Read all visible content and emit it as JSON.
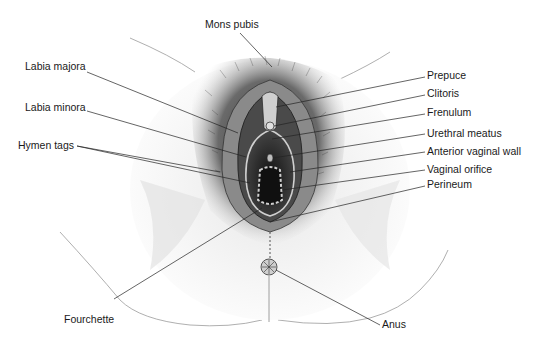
{
  "figure": {
    "labels": {
      "mons_pubis": "Mons pubis",
      "labia_majora": "Labia majora",
      "labia_minora": "Labia minora",
      "hymen_tags": "Hymen tags",
      "fourchette": "Fourchette",
      "prepuce": "Prepuce",
      "clitoris": "Clitoris",
      "frenulum": "Frenulum",
      "urethral_meatus": "Urethral meatus",
      "anterior_vaginal_wall": "Anterior vaginal wall",
      "vaginal_orifice": "Vaginal orifice",
      "perineum": "Perineum",
      "anus": "Anus"
    }
  }
}
